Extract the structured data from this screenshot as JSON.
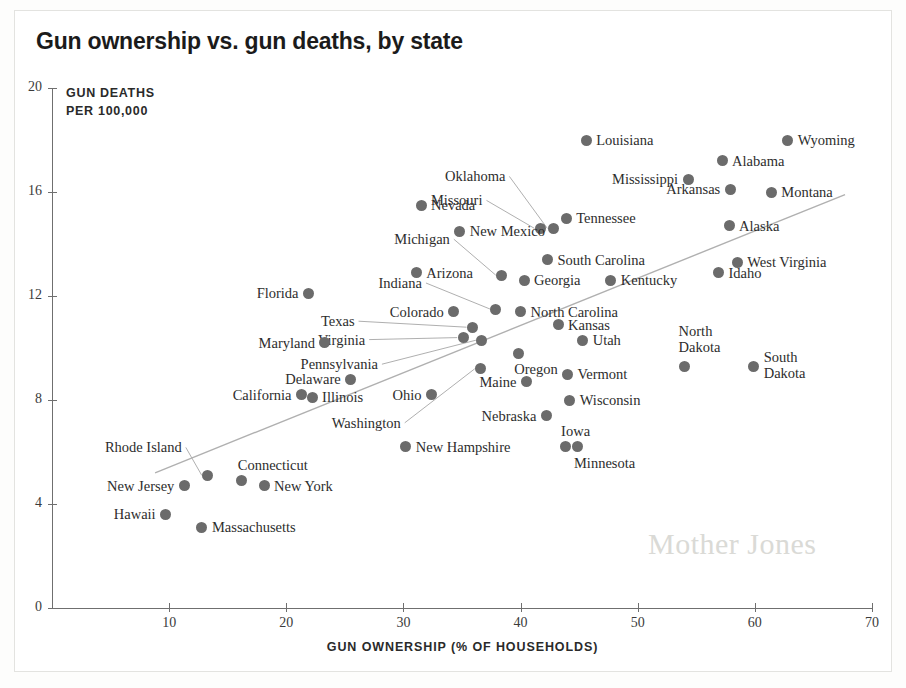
{
  "title": "Gun ownership vs. gun deaths, by state",
  "watermark": "Mother Jones",
  "chart_data": {
    "type": "scatter",
    "title": "Gun ownership vs. gun deaths, by state",
    "xlabel": "GUN OWNERSHIP (% OF HOUSEHOLDS)",
    "ylabel_line1": "GUN DEATHS",
    "ylabel_line2": "PER 100,000",
    "xlim": [
      0,
      70
    ],
    "ylim": [
      0,
      20
    ],
    "xticks": [
      0,
      10,
      20,
      30,
      40,
      50,
      60,
      70
    ],
    "yticks": [
      0,
      4,
      8,
      12,
      16,
      20
    ],
    "grid": false,
    "legend": null,
    "trendline": {
      "x1": 8.8,
      "y1": 5.2,
      "x2": 67.7,
      "y2": 15.9
    },
    "points": [
      {
        "label": "Louisiana",
        "x": 45.6,
        "y": 18.0,
        "side": "right"
      },
      {
        "label": "Wyoming",
        "x": 62.8,
        "y": 18.0,
        "side": "right"
      },
      {
        "label": "Alabama",
        "x": 57.2,
        "y": 17.2,
        "side": "right"
      },
      {
        "label": "Mississippi",
        "x": 54.3,
        "y": 16.5,
        "side": "left"
      },
      {
        "label": "Arkansas",
        "x": 57.9,
        "y": 16.1,
        "side": "left"
      },
      {
        "label": "Montana",
        "x": 61.4,
        "y": 16.0,
        "side": "right"
      },
      {
        "label": "Oklahoma",
        "x": 42.8,
        "y": 14.6,
        "side": "leader"
      },
      {
        "label": "Tennessee",
        "x": 43.9,
        "y": 15.0,
        "side": "right"
      },
      {
        "label": "Missouri",
        "x": 41.7,
        "y": 14.6,
        "side": "leader"
      },
      {
        "label": "Nevada",
        "x": 31.5,
        "y": 15.5,
        "side": "right"
      },
      {
        "label": "Alaska",
        "x": 57.8,
        "y": 14.7,
        "side": "right"
      },
      {
        "label": "New Mexico",
        "x": 34.8,
        "y": 14.5,
        "side": "right"
      },
      {
        "label": "South Carolina",
        "x": 42.3,
        "y": 13.4,
        "side": "right"
      },
      {
        "label": "West Virginia",
        "x": 58.5,
        "y": 13.3,
        "side": "right"
      },
      {
        "label": "Idaho",
        "x": 56.9,
        "y": 12.9,
        "side": "right"
      },
      {
        "label": "Arizona",
        "x": 31.1,
        "y": 12.9,
        "side": "right"
      },
      {
        "label": "Michigan",
        "x": 38.4,
        "y": 12.8,
        "side": "leader"
      },
      {
        "label": "Georgia",
        "x": 40.3,
        "y": 12.6,
        "side": "right"
      },
      {
        "label": "Kentucky",
        "x": 47.7,
        "y": 12.6,
        "side": "right"
      },
      {
        "label": "Florida",
        "x": 21.9,
        "y": 12.1,
        "side": "left"
      },
      {
        "label": "Indiana",
        "x": 37.9,
        "y": 11.5,
        "side": "leader"
      },
      {
        "label": "North Carolina",
        "x": 40.0,
        "y": 11.4,
        "side": "right"
      },
      {
        "label": "Colorado",
        "x": 34.3,
        "y": 11.4,
        "side": "left"
      },
      {
        "label": "Kansas",
        "x": 43.2,
        "y": 10.9,
        "side": "right"
      },
      {
        "label": "Texas",
        "x": 35.9,
        "y": 10.8,
        "side": "leader"
      },
      {
        "label": "Virginia",
        "x": 35.1,
        "y": 10.4,
        "side": "leader"
      },
      {
        "label": "Maryland",
        "x": 23.3,
        "y": 10.2,
        "side": "left"
      },
      {
        "label": "Utah",
        "x": 45.3,
        "y": 10.3,
        "side": "right"
      },
      {
        "label": "Pennsylvania",
        "x": 36.7,
        "y": 10.3,
        "side": "leader"
      },
      {
        "label": "Oregon",
        "x": 39.8,
        "y": 9.8,
        "side": "below"
      },
      {
        "label": "Delaware",
        "x": 25.5,
        "y": 8.8,
        "side": "left"
      },
      {
        "label": "Washington",
        "x": 36.6,
        "y": 9.2,
        "side": "leader"
      },
      {
        "label": "Vermont",
        "x": 44.0,
        "y": 9.0,
        "side": "right"
      },
      {
        "label": "Maine",
        "x": 40.5,
        "y": 8.7,
        "side": "left"
      },
      {
        "label": "North Dakota",
        "x": 54.0,
        "y": 9.3,
        "side": "above2"
      },
      {
        "label": "South Dakota",
        "x": 59.9,
        "y": 9.3,
        "side": "right2"
      },
      {
        "label": "California",
        "x": 21.3,
        "y": 8.2,
        "side": "left"
      },
      {
        "label": "Illinois",
        "x": 22.2,
        "y": 8.1,
        "side": "right"
      },
      {
        "label": "Ohio",
        "x": 32.4,
        "y": 8.2,
        "side": "left"
      },
      {
        "label": "Wisconsin",
        "x": 44.2,
        "y": 8.0,
        "side": "right"
      },
      {
        "label": "Nebraska",
        "x": 42.2,
        "y": 7.4,
        "side": "left"
      },
      {
        "label": "Iowa",
        "x": 43.8,
        "y": 6.2,
        "side": "above"
      },
      {
        "label": "Minnesota",
        "x": 44.9,
        "y": 6.2,
        "side": "below"
      },
      {
        "label": "New Hampshire",
        "x": 30.2,
        "y": 6.2,
        "side": "right"
      },
      {
        "label": "Rhode Island",
        "x": 13.3,
        "y": 5.1,
        "side": "leader"
      },
      {
        "label": "Connecticut",
        "x": 16.2,
        "y": 4.9,
        "side": "above"
      },
      {
        "label": "New Jersey",
        "x": 11.3,
        "y": 4.7,
        "side": "left"
      },
      {
        "label": "New York",
        "x": 18.1,
        "y": 4.7,
        "side": "right"
      },
      {
        "label": "Hawaii",
        "x": 9.7,
        "y": 3.6,
        "side": "left"
      },
      {
        "label": "Massachusetts",
        "x": 12.8,
        "y": 3.1,
        "side": "right"
      }
    ]
  }
}
